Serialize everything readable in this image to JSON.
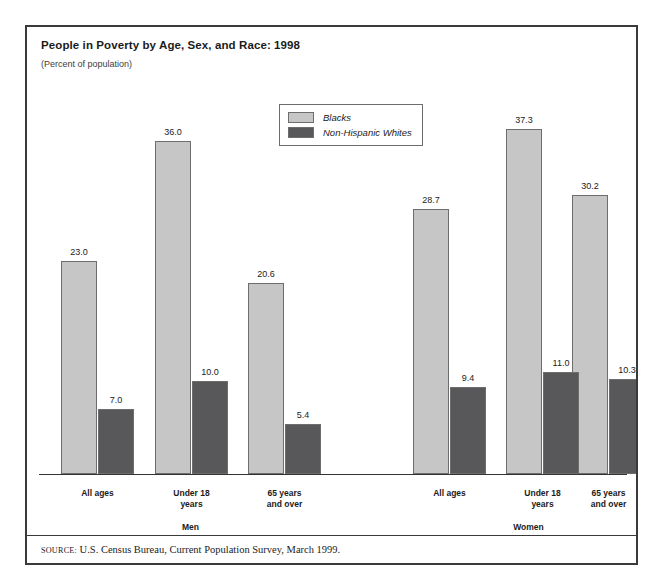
{
  "figure": {
    "title": "People in Poverty by Age, Sex, and Race: 1998",
    "subtitle": "(Percent of population)",
    "source_keyword": "SOURCE:",
    "source_text": "U.S. Census Bureau, Current Population Survey, March 1999."
  },
  "legend": {
    "items": [
      {
        "label": "Blacks",
        "color": "#c6c6c6"
      },
      {
        "label": "Non-Hispanic Whites",
        "color": "#58585b"
      }
    ]
  },
  "chart_data": {
    "type": "bar",
    "title": "People in Poverty by Age, Sex, and Race: 1998",
    "subtitle": "(Percent of population)",
    "xlabel": "",
    "ylabel": "Percent of population",
    "ylim": [
      0,
      40
    ],
    "grid": false,
    "legend_position": "top-center",
    "group_labels": [
      "Men",
      "Women"
    ],
    "categories": [
      "All ages",
      "Under 18 years",
      "65 years and over",
      "All ages",
      "Under 18 years",
      "65 years and over"
    ],
    "category_lines": [
      [
        "All ages"
      ],
      [
        "Under 18",
        "years"
      ],
      [
        "65 years",
        "and over"
      ],
      [
        "All ages"
      ],
      [
        "Under 18",
        "years"
      ],
      [
        "65 years",
        "and over"
      ]
    ],
    "series": [
      {
        "name": "Blacks",
        "color": "#c6c6c6",
        "values": [
          23.0,
          36.0,
          20.6,
          28.7,
          37.3,
          30.2
        ]
      },
      {
        "name": "Non-Hispanic Whites",
        "color": "#58585b",
        "values": [
          7.0,
          10.0,
          5.4,
          9.4,
          11.0,
          10.3
        ]
      }
    ],
    "value_labels": {
      "Blacks": [
        "23.0",
        "36.0",
        "20.6",
        "28.7",
        "37.3",
        "30.2"
      ],
      "Non-Hispanic Whites": [
        "7.0",
        "10.0",
        "5.4",
        "9.4",
        "11.0",
        "10.3"
      ]
    }
  }
}
